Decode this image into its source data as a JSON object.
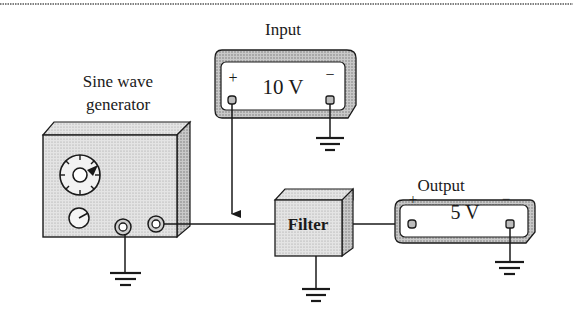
{
  "diagram": {
    "type": "circuit-block-diagram",
    "blocks": {
      "generator": {
        "label_line1": "Sine wave",
        "label_line2": "generator"
      },
      "input_meter": {
        "title": "Input",
        "reading": "10 V",
        "plus": "+",
        "minus": "−"
      },
      "filter": {
        "label": "Filter"
      },
      "output_meter": {
        "title": "Output",
        "reading": "5 V",
        "plus": "+",
        "minus": "−"
      }
    },
    "connections": [
      {
        "from": "generator",
        "to": "filter"
      },
      {
        "from": "input_meter.plus",
        "to": "generator-filter wire",
        "arrow": true
      },
      {
        "from": "filter",
        "to": "output_meter.plus"
      },
      {
        "from": "generator",
        "to": "ground"
      },
      {
        "from": "filter",
        "to": "ground"
      },
      {
        "from": "input_meter.minus",
        "to": "ground"
      },
      {
        "from": "output_meter.minus",
        "to": "ground"
      }
    ],
    "colors": {
      "line": "#1a1a1a",
      "box_fill": "#d9d9d9",
      "box_side": "#b8b8b8",
      "meter_face": "#ffffff",
      "meter_frame": "#bdbdbd"
    }
  }
}
